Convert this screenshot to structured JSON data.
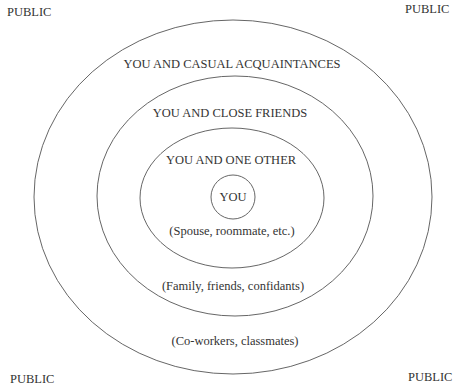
{
  "diagram": {
    "corners": [
      "PUBLIC",
      "PUBLIC",
      "PUBLIC",
      "PUBLIC"
    ],
    "zones": [
      {
        "name": "casual",
        "label": "YOU AND CASUAL ACQUAINTANCES",
        "sublabel": "(Co-workers, classmates)"
      },
      {
        "name": "close",
        "label": "YOU AND CLOSE FRIENDS",
        "sublabel": "(Family, friends, confidants)"
      },
      {
        "name": "one",
        "label": "YOU AND ONE OTHER",
        "sublabel": "(Spouse, roommate, etc.)"
      },
      {
        "name": "you",
        "label": "YOU"
      }
    ],
    "colors": {
      "stroke": "#555555",
      "text": "#333333",
      "background": "#ffffff"
    }
  }
}
